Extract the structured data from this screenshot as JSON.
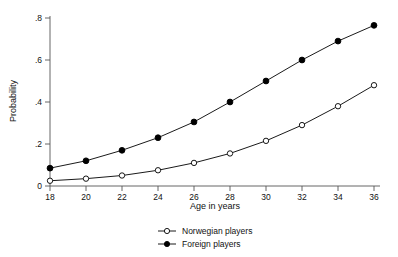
{
  "chart_data": {
    "type": "line",
    "title": "",
    "subtitle": "",
    "xlabel": "Age in years",
    "ylabel": "Probability",
    "x": [
      18,
      20,
      22,
      24,
      26,
      28,
      30,
      32,
      34,
      36
    ],
    "xtick_labels": [
      "18",
      "20",
      "22",
      "24",
      "26",
      "28",
      "30",
      "32",
      "34",
      "36"
    ],
    "ytick_labels": [
      "0",
      ".2",
      ".4",
      ".6",
      ".8"
    ],
    "ytick_values": [
      0,
      0.2,
      0.4,
      0.6,
      0.8
    ],
    "xlim": [
      18,
      36
    ],
    "ylim": [
      0,
      0.8
    ],
    "grid": false,
    "legend_position": "bottom-center",
    "series": [
      {
        "name": "Norwegian players",
        "marker": "open-circle",
        "color": "#000000",
        "values": [
          0.025,
          0.035,
          0.05,
          0.075,
          0.11,
          0.155,
          0.215,
          0.29,
          0.38,
          0.48
        ]
      },
      {
        "name": "Foreign players",
        "marker": "filled-circle",
        "color": "#000000",
        "values": [
          0.085,
          0.12,
          0.17,
          0.23,
          0.305,
          0.4,
          0.5,
          0.6,
          0.69,
          0.765
        ]
      }
    ]
  },
  "legend": {
    "items": [
      {
        "label": "Norwegian players",
        "marker": "open-circle"
      },
      {
        "label": "Foreign players",
        "marker": "filled-circle"
      }
    ]
  }
}
